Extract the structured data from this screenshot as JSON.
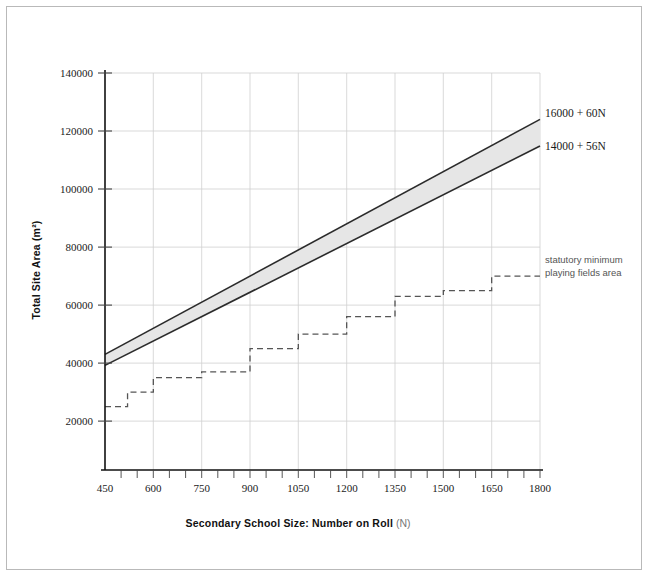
{
  "figure": {
    "frame_color": "#b9b9b9",
    "background": "#ffffff"
  },
  "chart_data": {
    "type": "line",
    "title": "",
    "xlabel": "Secondary School Size: Number on Roll",
    "xlabel_suffix": "(N)",
    "ylabel": "Total Site Area (m²)",
    "xlim": [
      450,
      1800
    ],
    "ylim": [
      0,
      140000
    ],
    "xticks": [
      450,
      600,
      750,
      900,
      1050,
      1200,
      1350,
      1500,
      1650,
      1800
    ],
    "xtick_labels": [
      "450",
      "600",
      "750",
      "900",
      "1050",
      "1200",
      "1350",
      "1500",
      "1650",
      "1800"
    ],
    "xminor_step": 50,
    "yticks": [
      20000,
      40000,
      60000,
      80000,
      100000,
      120000,
      140000
    ],
    "ytick_labels": [
      "20000",
      "40000",
      "60000",
      "80000",
      "100000",
      "120000",
      "140000"
    ],
    "grid": true,
    "grid_color": "#cfcfcf",
    "legend": "annotations-right",
    "series": [
      {
        "name": "upper-site-area-line",
        "label": "16000 + 60N",
        "style": "solid",
        "color": "#333333",
        "formula": {
          "intercept": 16000,
          "slope": 60
        },
        "x": [
          450,
          1800
        ],
        "values": [
          43000,
          124000
        ]
      },
      {
        "name": "lower-site-area-line",
        "label": "14000 + 56N",
        "style": "solid",
        "color": "#333333",
        "formula": {
          "intercept": 14000,
          "slope": 56
        },
        "x": [
          450,
          1800
        ],
        "values": [
          39200,
          114800
        ]
      },
      {
        "name": "statutory-minimum-playing-fields",
        "label": "statutory minimum playing fields area",
        "style": "dashed",
        "color": "#555555",
        "step": true,
        "x": [
          450,
          520,
          600,
          680,
          750,
          830,
          900,
          980,
          1050,
          1120,
          1200,
          1280,
          1350,
          1430,
          1500,
          1580,
          1650,
          1730,
          1800
        ],
        "values": [
          25000,
          25000,
          30000,
          35000,
          35000,
          37000,
          37000,
          41000,
          45000,
          45000,
          46000,
          50000,
          50000,
          55000,
          56000,
          56000,
          63000,
          65000,
          70000
        ],
        "steps": [
          {
            "x_start": 450,
            "x_end": 520,
            "y": 25000
          },
          {
            "x_start": 520,
            "x_end": 600,
            "y": 30000
          },
          {
            "x_start": 600,
            "x_end": 750,
            "y": 35000
          },
          {
            "x_start": 750,
            "x_end": 900,
            "y": 37000
          },
          {
            "x_start": 900,
            "x_end": 1050,
            "y": 45000
          },
          {
            "x_start": 1050,
            "x_end": 1200,
            "y": 50000
          },
          {
            "x_start": 1200,
            "x_end": 1350,
            "y": 56000
          },
          {
            "x_start": 1350,
            "x_end": 1500,
            "y": 63000
          },
          {
            "x_start": 1500,
            "x_end": 1650,
            "y": 65000
          },
          {
            "x_start": 1650,
            "x_end": 1800,
            "y": 70000
          }
        ]
      }
    ],
    "band": {
      "name": "site-area-band",
      "fill": "#e6e6e6",
      "edge": "#2b2b2b",
      "between": [
        "16000 + 60N",
        "14000 + 56N"
      ]
    },
    "annotations": [
      {
        "name": "upper-line-label",
        "text": "16000 + 60N",
        "x": 1800,
        "y": 124000
      },
      {
        "name": "lower-line-label",
        "text": "14000 + 56N",
        "x": 1800,
        "y": 114800
      },
      {
        "name": "playing-fields-note-line1",
        "text": "statutory minimum",
        "x": 1800,
        "y": 70000
      },
      {
        "name": "playing-fields-note-line2",
        "text": "playing fields area",
        "x": 1800,
        "y": 67000
      }
    ]
  }
}
